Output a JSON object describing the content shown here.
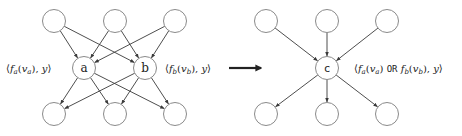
{
  "left_graph": {
    "top_nodes": [
      {
        "id": "t1",
        "x": 54,
        "y": 21
      },
      {
        "id": "t2",
        "x": 115,
        "y": 21
      },
      {
        "id": "t3",
        "x": 175,
        "y": 21
      }
    ],
    "middle_nodes": [
      {
        "id": "a",
        "label": "a",
        "x": 84,
        "y": 68
      },
      {
        "id": "b",
        "label": "b",
        "x": 145,
        "y": 68
      }
    ],
    "bottom_nodes": [
      {
        "id": "o1",
        "x": 54,
        "y": 114
      },
      {
        "id": "o2",
        "x": 115,
        "y": 114
      },
      {
        "id": "o3",
        "x": 175,
        "y": 114
      }
    ],
    "label_a": {
      "open": "⟨",
      "f": "f",
      "f_sub": "a",
      "arg_open": "(",
      "v": "v",
      "v_sub": "a",
      "arg_close": ")",
      "sep": ", ",
      "y": "y",
      "close": "⟩"
    },
    "label_b": {
      "open": "⟨",
      "f": "f",
      "f_sub": "b",
      "arg_open": "(",
      "v": "v",
      "v_sub": "b",
      "arg_close": ")",
      "sep": ", ",
      "y": "y",
      "close": "⟩"
    }
  },
  "transform_arrow": {
    "x1": 229,
    "x2": 261,
    "y": 68
  },
  "right_graph": {
    "top_nodes": [
      {
        "id": "t1",
        "x": 266,
        "y": 21
      },
      {
        "id": "t2",
        "x": 327,
        "y": 21
      },
      {
        "id": "t3",
        "x": 387,
        "y": 21
      }
    ],
    "middle_node": {
      "id": "c",
      "label": "c",
      "x": 327,
      "y": 68
    },
    "bottom_nodes": [
      {
        "id": "o1",
        "x": 266,
        "y": 114
      },
      {
        "id": "o2",
        "x": 327,
        "y": 114
      },
      {
        "id": "o3",
        "x": 387,
        "y": 114
      }
    ],
    "label_c": {
      "open": "⟨",
      "f1": "f",
      "f1_sub": "a",
      "v1": "v",
      "v1_sub": "a",
      "op": "OR",
      "f2": "f",
      "f2_sub": "b",
      "v2": "v",
      "v2_sub": "b",
      "sep": ", ",
      "y": "y",
      "close": "⟩"
    }
  },
  "style": {
    "node_stroke": "#8a8a8a",
    "edge_stroke": "#3a3a3a",
    "text": "#222222"
  }
}
